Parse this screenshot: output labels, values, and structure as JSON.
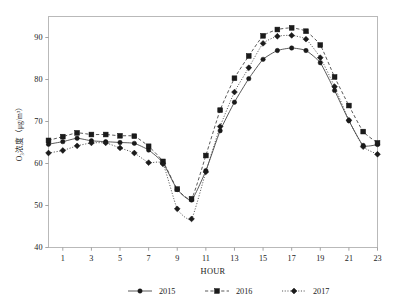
{
  "chart_data": {
    "type": "line",
    "title": "",
    "subtitle": "",
    "xlabel": "HOUR",
    "ylabel": "O₃浓度（μg/m³）",
    "x": [
      0,
      1,
      2,
      3,
      4,
      5,
      6,
      7,
      8,
      9,
      10,
      11,
      12,
      13,
      14,
      15,
      16,
      17,
      18,
      19,
      20,
      21,
      22,
      23
    ],
    "xlim": [
      0,
      23
    ],
    "ylim": [
      40,
      95
    ],
    "xticks": [
      1,
      3,
      5,
      7,
      9,
      11,
      13,
      15,
      17,
      19,
      21,
      23
    ],
    "xticks_labels": [
      "1",
      "3",
      "5",
      "7",
      "9",
      "11",
      "13",
      "15",
      "17",
      "19",
      "21",
      "23"
    ],
    "yticks": [
      40,
      50,
      60,
      70,
      80,
      90
    ],
    "yticks_labels": [
      "40",
      "50",
      "60",
      "70",
      "80",
      "90"
    ],
    "grid": false,
    "legend_position": "bottom",
    "series": [
      {
        "name": "2015",
        "line_style": "solid",
        "marker": "circle",
        "color": "#2b2b2b",
        "values": [
          64.6,
          65.2,
          66.0,
          65.4,
          65.2,
          65.0,
          64.8,
          63.2,
          60.2,
          53.8,
          51.3,
          58.3,
          67.8,
          74.6,
          80.2,
          84.8,
          86.9,
          87.5,
          86.9,
          84.0,
          77.4,
          70.2,
          64.3,
          64.5
        ]
      },
      {
        "name": "2016",
        "line_style": "dashed",
        "marker": "square",
        "color": "#151515",
        "values": [
          65.5,
          66.4,
          67.3,
          66.9,
          66.9,
          66.6,
          66.5,
          64.1,
          60.5,
          53.9,
          51.6,
          61.9,
          72.7,
          80.3,
          85.6,
          90.4,
          91.9,
          92.3,
          91.5,
          88.2,
          80.6,
          73.8,
          67.6,
          64.9
        ]
      },
      {
        "name": "2017",
        "line_style": "dotted",
        "marker": "diamond",
        "color": "#3a3a3a",
        "values": [
          62.5,
          63.1,
          64.2,
          64.9,
          64.9,
          63.7,
          62.5,
          60.2,
          59.9,
          49.2,
          46.8,
          58.0,
          68.8,
          77.0,
          82.8,
          88.6,
          90.3,
          90.5,
          89.6,
          85.2,
          78.3,
          70.3,
          64.0,
          62.2
        ]
      }
    ]
  },
  "legend": {
    "entries": [
      {
        "label": "2015"
      },
      {
        "label": "2016"
      },
      {
        "label": "2017"
      }
    ]
  },
  "axes": {
    "x_title": "HOUR",
    "y_title": "O₃浓度（μg/m³）"
  }
}
